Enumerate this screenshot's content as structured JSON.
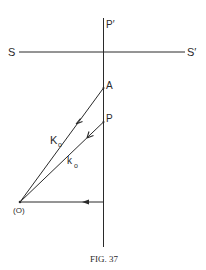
{
  "figure": {
    "caption": "FIG. 37",
    "labels": {
      "S": "S",
      "S_prime": "S′",
      "P_prime": "P′",
      "A": "A",
      "P": "P",
      "K0_main": "K",
      "K0_sub": "o",
      "k0_main": "k",
      "k0_sub": "o",
      "O": "(O)"
    }
  },
  "colors": {
    "ink": "#2a2a2a",
    "background": "#ffffff"
  }
}
